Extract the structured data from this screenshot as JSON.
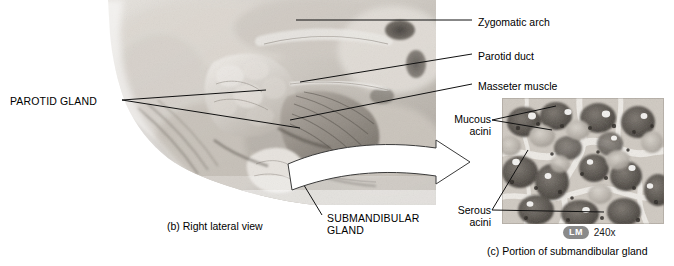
{
  "figure": {
    "background_color": "#ffffff",
    "width": 674,
    "height": 266
  },
  "panel_b": {
    "caption": "(b) Right lateral view",
    "image_type": "cadaver-dissection-photograph",
    "image_tone": "grayscale",
    "labels": [
      {
        "id": "parotid-gland",
        "text": "PAROTID GLAND",
        "style": "uppercase",
        "side": "left",
        "leader_count": 2
      },
      {
        "id": "zygomatic-arch",
        "text": "Zygomatic arch",
        "style": "sentence",
        "side": "right",
        "leader_count": 1
      },
      {
        "id": "parotid-duct",
        "text": "Parotid duct",
        "style": "sentence",
        "side": "right",
        "leader_count": 1
      },
      {
        "id": "masseter-muscle",
        "text": "Masseter muscle",
        "style": "sentence",
        "side": "right",
        "leader_count": 1
      },
      {
        "id": "submandibular-gland",
        "text_line1": "SUBMANDIBULAR",
        "text_line2": "GLAND",
        "style": "uppercase",
        "side": "bottom",
        "leader_count": 1
      }
    ]
  },
  "panel_c": {
    "caption": "(c) Portion of submandibular gland",
    "image_type": "light-micrograph",
    "image_tone": "grayscale",
    "magnification": {
      "method": "LM",
      "value": "240x",
      "pill_color": "#8a8a8a",
      "pill_text_color": "#ffffff"
    },
    "labels": [
      {
        "id": "mucous-acini",
        "text_line1": "Mucous",
        "text_line2": "acini",
        "leader_count": 2
      },
      {
        "id": "serous-acini",
        "text_line1": "Serous",
        "text_line2": "acini",
        "leader_count": 2
      }
    ]
  },
  "connector": {
    "id": "zoom-arrow",
    "shape": "curved-outline-arrow",
    "from_panel": "panel_b",
    "to_panel": "panel_c",
    "fill": "#ffffff",
    "stroke": "#3a3a3a"
  },
  "colors": {
    "leader_line": "#111111",
    "text": "#000000",
    "background": "#ffffff",
    "badge_gray": "#8a8a8a"
  }
}
